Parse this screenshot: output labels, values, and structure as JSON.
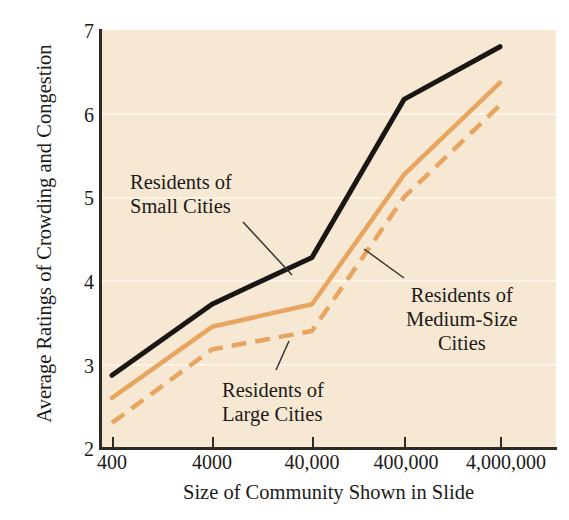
{
  "figure": {
    "background_color": "#ffffff",
    "plot_background_color": "#f7e8d3",
    "gridline_color": "#fdf4e8",
    "axis_color": "#2e2a26"
  },
  "chart_data": {
    "type": "line",
    "title": "",
    "xlabel": "Size of Community Shown in Slide",
    "ylabel": "Average Ratings of Crowding and Congestion",
    "x_tick_labels": [
      "400",
      "4000",
      "40,000",
      "400,000",
      "4,000,000"
    ],
    "x_scale": "log-categorical",
    "y_tick_labels": [
      "2",
      "3",
      "4",
      "5",
      "6",
      "7"
    ],
    "ylim": [
      2,
      7
    ],
    "grid": "horizontal",
    "legend": "inline-annotations",
    "series": [
      {
        "name": "Residents of Small Cities",
        "color": "#1a1614",
        "style": "solid",
        "values": [
          2.87,
          3.72,
          4.28,
          6.17,
          6.8
        ]
      },
      {
        "name": "Residents of Medium-Size Cities",
        "color": "#e8a560",
        "style": "solid",
        "values": [
          2.6,
          3.45,
          3.72,
          5.27,
          6.37
        ]
      },
      {
        "name": "Residents of Large Cities",
        "color": "#e8a560",
        "style": "dashed",
        "values": [
          2.3,
          3.18,
          3.4,
          5.0,
          6.1
        ]
      }
    ],
    "annotations": [
      {
        "id": "small",
        "lines": [
          "Residents of",
          "Small Cities"
        ]
      },
      {
        "id": "large",
        "lines": [
          "Residents of",
          "Large Cities"
        ]
      },
      {
        "id": "medium",
        "lines": [
          "Residents of",
          "Medium-Size",
          "Cities"
        ]
      }
    ]
  }
}
